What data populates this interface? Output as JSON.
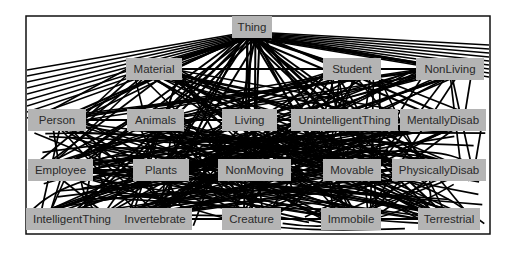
{
  "diagram": {
    "type": "ontology-graph",
    "root": "Thing",
    "nodes": [
      {
        "id": "thing",
        "label": "Thing",
        "x": 232,
        "y": 16,
        "w": 40
      },
      {
        "id": "material",
        "label": "Material",
        "x": 126,
        "y": 58,
        "w": 56
      },
      {
        "id": "student",
        "label": "Student",
        "x": 323,
        "y": 58,
        "w": 58
      },
      {
        "id": "nonliving",
        "label": "NonLiving",
        "x": 416,
        "y": 58,
        "w": 68
      },
      {
        "id": "person",
        "label": "Person",
        "x": 28,
        "y": 109,
        "w": 58
      },
      {
        "id": "animals",
        "label": "Animals",
        "x": 127,
        "y": 109,
        "w": 57
      },
      {
        "id": "living",
        "label": "Living",
        "x": 222,
        "y": 109,
        "w": 55
      },
      {
        "id": "unintelligentthing",
        "label": "UnintelligentThing",
        "x": 291,
        "y": 109,
        "w": 107
      },
      {
        "id": "mentallydisab",
        "label": "MentallyDisab",
        "x": 400,
        "y": 109,
        "w": 86
      },
      {
        "id": "employee",
        "label": "Employee",
        "x": 28,
        "y": 159,
        "w": 65
      },
      {
        "id": "plants",
        "label": "Plants",
        "x": 133,
        "y": 159,
        "w": 56
      },
      {
        "id": "nonmoving",
        "label": "NonMoving",
        "x": 218,
        "y": 159,
        "w": 73
      },
      {
        "id": "movable",
        "label": "Movable",
        "x": 323,
        "y": 159,
        "w": 58
      },
      {
        "id": "physicallydisab",
        "label": "PhysicallyDisab",
        "x": 392,
        "y": 159,
        "w": 94
      },
      {
        "id": "intelligentthing",
        "label": "IntelligentThing",
        "x": 26,
        "y": 208,
        "w": 92
      },
      {
        "id": "invertebrate",
        "label": "Invertebrate",
        "x": 118,
        "y": 208,
        "w": 74
      },
      {
        "id": "creature",
        "label": "Creature",
        "x": 222,
        "y": 208,
        "w": 59
      },
      {
        "id": "immobile",
        "label": "Immobile",
        "x": 321,
        "y": 208,
        "w": 60
      },
      {
        "id": "terrestrial",
        "label": "Terrestrial",
        "x": 418,
        "y": 208,
        "w": 62
      }
    ]
  }
}
